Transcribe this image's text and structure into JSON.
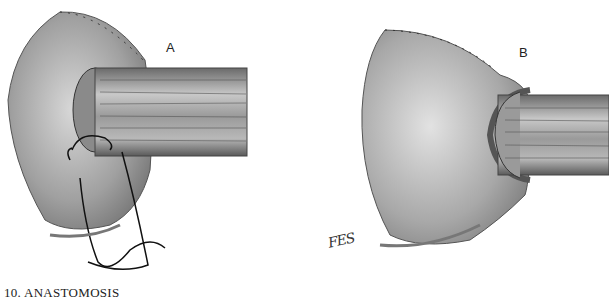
{
  "figure": {
    "panels": [
      {
        "label": "A",
        "description": "anastomosis with running suture being placed"
      },
      {
        "label": "B",
        "description": "completed anastomosis with cuff over tube"
      }
    ],
    "signature": "FES",
    "caption": "10.  ANASTOMOSIS"
  }
}
